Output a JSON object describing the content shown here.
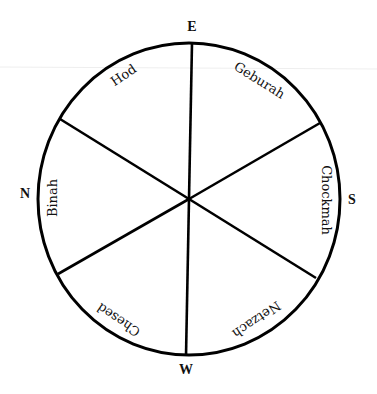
{
  "diagram": {
    "type": "circular-compass-wheel",
    "stroke_color": "#000000",
    "background_color": "#ffffff",
    "directions": {
      "top": "E",
      "right": "S",
      "bottom": "W",
      "left": "N"
    },
    "sectors": [
      {
        "position": "upper-left",
        "label": "Hod"
      },
      {
        "position": "upper-right",
        "label": "Geburah"
      },
      {
        "position": "right",
        "label": "Chockmah"
      },
      {
        "position": "lower-right",
        "label": "Netzach"
      },
      {
        "position": "lower-left",
        "label": "Chesed"
      },
      {
        "position": "left",
        "label": "Binah"
      }
    ]
  }
}
